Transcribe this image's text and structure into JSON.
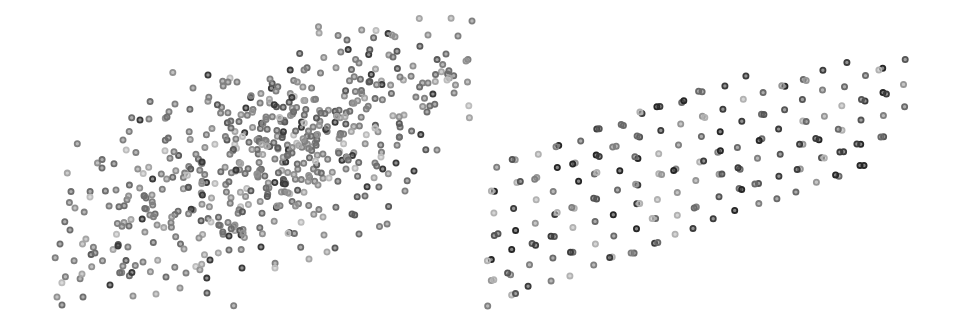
{
  "chart_data": [
    {
      "type": "scatter",
      "title": "",
      "xlabel": "",
      "ylabel": "",
      "grid": false,
      "legend": null,
      "description": "Random Gaussian point cloud elongated along a diagonal (positive correlation), ~500 points, grayscale ring markers",
      "marker": {
        "shape": "ring",
        "diameter_px": 7,
        "colors": [
          "#3a3a3a",
          "#5a5a5a",
          "#6e6e6e",
          "#808080",
          "#929292",
          "#a6a6a6",
          "#bdbdbd"
        ]
      },
      "generator": {
        "seed": 17,
        "count": 520,
        "center_px": [
          268,
          158
        ],
        "major_axis_angle_deg": -28,
        "sigma_major_px": 105,
        "sigma_minor_px": 38,
        "bounds_px": {
          "x": [
            55,
            475
          ],
          "y": [
            12,
            312
          ]
        }
      },
      "sample_points_px": [
        [
          472,
          21
        ],
        [
          347,
          40
        ],
        [
          392,
          35
        ],
        [
          428,
          35
        ],
        [
          458,
          36
        ],
        [
          466,
          61
        ],
        [
          446,
          54
        ],
        [
          359,
          63
        ],
        [
          413,
          66
        ],
        [
          400,
          77
        ],
        [
          428,
          83
        ],
        [
          447,
          80
        ],
        [
          304,
          70
        ],
        [
          369,
          82
        ],
        [
          393,
          57
        ],
        [
          230,
          78
        ],
        [
          208,
          75
        ],
        [
          228,
          82
        ],
        [
          237,
          82
        ],
        [
          270,
          79
        ],
        [
          276,
          91
        ],
        [
          193,
          88
        ],
        [
          175,
          104
        ],
        [
          149,
          119
        ],
        [
          167,
          117
        ],
        [
          140,
          120
        ],
        [
          123,
          140
        ],
        [
          102,
          168
        ],
        [
          90,
          197
        ],
        [
          75,
          208
        ],
        [
          60,
          244
        ],
        [
          70,
          230
        ],
        [
          95,
          253
        ],
        [
          82,
          274
        ],
        [
          57,
          297
        ],
        [
          62,
          305
        ],
        [
          83,
          297
        ],
        [
          133,
          296
        ],
        [
          156,
          294
        ],
        [
          180,
          288
        ],
        [
          207,
          293
        ],
        [
          242,
          268
        ],
        [
          275,
          268
        ],
        [
          309,
          259
        ],
        [
          327,
          252
        ],
        [
          335,
          248
        ],
        [
          359,
          234
        ],
        [
          437,
          150
        ],
        [
          405,
          191
        ],
        [
          414,
          171
        ],
        [
          396,
          163
        ],
        [
          381,
          157
        ],
        [
          236,
          170
        ],
        [
          277,
          206
        ],
        [
          285,
          184
        ],
        [
          318,
          185
        ],
        [
          329,
          178
        ],
        [
          346,
          169
        ],
        [
          210,
          260
        ],
        [
          211,
          222
        ],
        [
          184,
          249
        ],
        [
          143,
          262
        ],
        [
          129,
          226
        ],
        [
          116,
          190
        ],
        [
          152,
          195
        ],
        [
          266,
          117
        ],
        [
          292,
          153
        ],
        [
          323,
          217
        ],
        [
          365,
          196
        ],
        [
          352,
          214
        ],
        [
          261,
          247
        ],
        [
          229,
          250
        ],
        [
          199,
          238
        ],
        [
          166,
          277
        ],
        [
          118,
          246
        ]
      ]
    },
    {
      "type": "scatter",
      "title": "",
      "xlabel": "",
      "ylabel": "",
      "grid": false,
      "legend": null,
      "description": "Sheared regular lattice of points (quasi-random / grid-like sample) forming a diagonal parallelogram, many near-duplicate overlapping points, grayscale ring markers",
      "marker": {
        "shape": "ring",
        "diameter_px": 7,
        "colors": [
          "#262626",
          "#3c3c3c",
          "#555555",
          "#6a6a6a",
          "#808080",
          "#979797",
          "#b2b2b2"
        ]
      },
      "lattice": {
        "origin_px": [
          489,
          304
        ],
        "vector_a_px": [
          20.6,
          -7.6
        ],
        "vector_b_px": [
          1.2,
          -22.5
        ],
        "a_range": [
          0,
          20
        ],
        "b_range": [
          0,
          11
        ],
        "clip_polygon_px": [
          [
            486,
            307
          ],
          [
            745,
            290
          ],
          [
            908,
            118
          ],
          [
            908,
            48
          ],
          [
            700,
            82
          ],
          [
            486,
            170
          ]
        ],
        "jitter_px": 2.5,
        "duplicate_probability": 0.45,
        "duplicate_offset_px": [
          3,
          1
        ],
        "seed": 29
      },
      "sample_points_px": [
        [
          489,
          304
        ],
        [
          510,
          300
        ],
        [
          530,
          293
        ],
        [
          551,
          284
        ],
        [
          573,
          276
        ],
        [
          594,
          280
        ],
        [
          617,
          267
        ],
        [
          637,
          284
        ],
        [
          656,
          279
        ],
        [
          679,
          258
        ],
        [
          701,
          261
        ],
        [
          727,
          252
        ],
        [
          749,
          238
        ],
        [
          771,
          243
        ],
        [
          796,
          236
        ],
        [
          815,
          225
        ],
        [
          837,
          205
        ],
        [
          857,
          209
        ],
        [
          880,
          153
        ],
        [
          904,
          51
        ],
        [
          903,
          73
        ],
        [
          882,
          60
        ],
        [
          862,
          66
        ],
        [
          840,
          75
        ],
        [
          819,
          81
        ],
        [
          783,
          81
        ],
        [
          759,
          73
        ],
        [
          738,
          77
        ],
        [
          719,
          84
        ],
        [
          686,
          93
        ],
        [
          642,
          100
        ],
        [
          621,
          110
        ],
        [
          582,
          100
        ],
        [
          565,
          128
        ],
        [
          557,
          180
        ],
        [
          550,
          193
        ],
        [
          537,
          174
        ],
        [
          492,
          175
        ],
        [
          492,
          197
        ],
        [
          505,
          214
        ],
        [
          520,
          230
        ],
        [
          501,
          262
        ],
        [
          527,
          281
        ],
        [
          548,
          279
        ],
        [
          600,
          280
        ],
        [
          652,
          284
        ],
        [
          713,
          283
        ],
        [
          781,
          269
        ]
      ]
    }
  ]
}
